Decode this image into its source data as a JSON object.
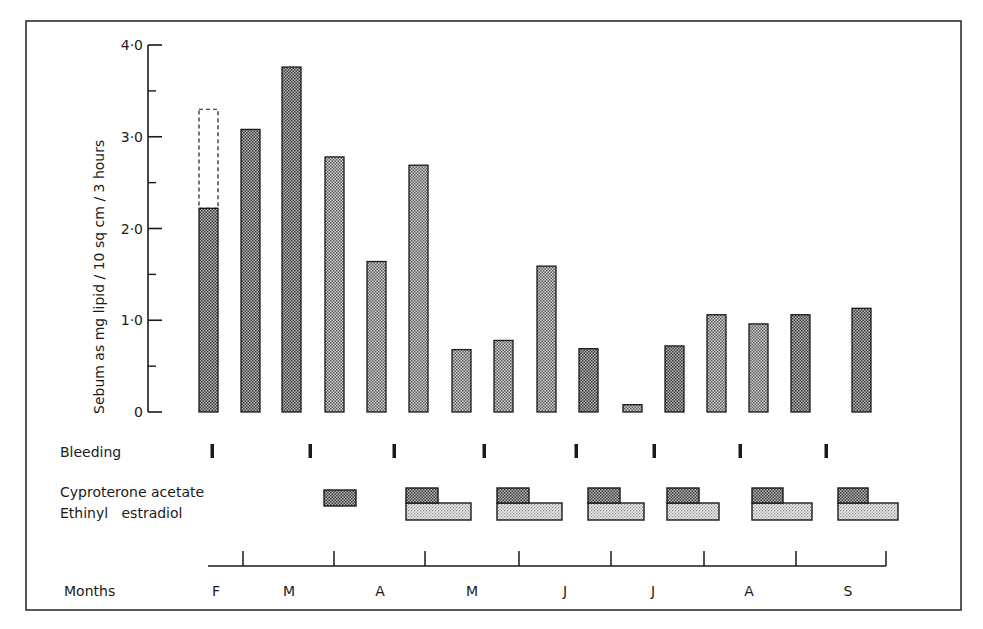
{
  "chart_data": {
    "type": "bar",
    "title": "",
    "ylabel": "Sebum as mg lipid / 10 sq cm / 3 hours",
    "xlabel": "Months",
    "ylim": [
      0,
      4.0
    ],
    "yticks": [
      {
        "value": 0,
        "label": "0"
      },
      {
        "value": 1.0,
        "label": "1·0"
      },
      {
        "value": 2.0,
        "label": "2·0"
      },
      {
        "value": 3.0,
        "label": "3·0"
      },
      {
        "value": 4.0,
        "label": "4·0"
      }
    ],
    "yminor": [
      0.5,
      1.5,
      2.5,
      3.5
    ],
    "grid": false,
    "bars": [
      {
        "x": 199,
        "value": 2.22,
        "dashed_extension": 3.3,
        "shade": "dark"
      },
      {
        "x": 241,
        "value": 3.08,
        "shade": "dark"
      },
      {
        "x": 282,
        "value": 3.76,
        "shade": "dark"
      },
      {
        "x": 325,
        "value": 2.78,
        "shade": "medium"
      },
      {
        "x": 367,
        "value": 1.64,
        "shade": "medium"
      },
      {
        "x": 409,
        "value": 2.69,
        "shade": "medium"
      },
      {
        "x": 452,
        "value": 0.68,
        "shade": "medium"
      },
      {
        "x": 494,
        "value": 0.78,
        "shade": "medium"
      },
      {
        "x": 537,
        "value": 1.59,
        "shade": "medium"
      },
      {
        "x": 579,
        "value": 0.69,
        "shade": "dark"
      },
      {
        "x": 623,
        "value": 0.08,
        "shade": "medium"
      },
      {
        "x": 665,
        "value": 0.72,
        "shade": "dark"
      },
      {
        "x": 707,
        "value": 1.06,
        "shade": "medium"
      },
      {
        "x": 749,
        "value": 0.96,
        "shade": "medium"
      },
      {
        "x": 791,
        "value": 1.06,
        "shade": "dark"
      },
      {
        "x": 852,
        "value": 1.13,
        "shade": "dark"
      }
    ],
    "rows": {
      "bleeding": {
        "label": "Bleeding",
        "marks_x": [
          212,
          310,
          394,
          484,
          576,
          654,
          740,
          826
        ]
      },
      "cyproterone_acetate": {
        "label": "Cyproterone acetate",
        "blocks": [
          [
            324,
            356
          ],
          [
            406,
            438
          ],
          [
            497,
            529
          ],
          [
            588,
            620
          ],
          [
            667,
            699
          ],
          [
            752,
            783
          ],
          [
            838,
            868
          ]
        ]
      },
      "ethinyl_estradiol": {
        "label": "Ethinyl   estradiol",
        "blocks": [
          [
            406,
            471
          ],
          [
            497,
            562
          ],
          [
            588,
            644
          ],
          [
            667,
            719
          ],
          [
            752,
            812
          ],
          [
            838,
            898
          ]
        ]
      }
    },
    "months": {
      "label": "Months",
      "axis_start": 208,
      "axis_end": 886,
      "ticks_x": [
        243,
        334,
        425,
        519,
        611,
        704,
        796,
        886
      ],
      "labels": [
        {
          "text": "F",
          "x": 216
        },
        {
          "text": "M",
          "x": 289
        },
        {
          "text": "A",
          "x": 380
        },
        {
          "text": "M",
          "x": 472
        },
        {
          "text": "J",
          "x": 565
        },
        {
          "text": "J",
          "x": 653
        },
        {
          "text": "A",
          "x": 749
        },
        {
          "text": "S",
          "x": 848
        }
      ]
    }
  },
  "colors": {
    "ink": "#1a1a1a",
    "dark_fill": "#8a8a8a",
    "medium_fill": "#a8a8a8",
    "light_fill": "#d6d6d6",
    "frame": "#222222"
  }
}
